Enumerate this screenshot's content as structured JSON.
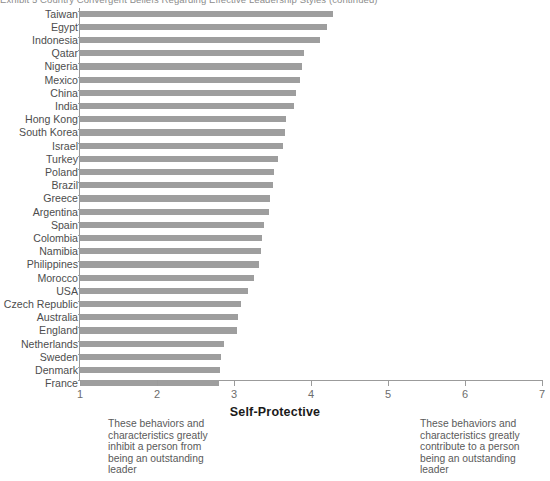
{
  "figure": {
    "title": "Exhibit 5    Country Convergent Beliefs Regarding Effective Leadership Styles (continued)",
    "axis_title": "Self-Protective",
    "note_left": "These behaviors and characteristics greatly inhibit a person from being an outstanding leader",
    "note_right": "These behaviors and characteristics greatly contribute to a person being an outstanding leader",
    "bar_color": "#9e9e9e",
    "axis_color": "#9b9b9b"
  },
  "chart_data": {
    "type": "bar",
    "orientation": "horizontal",
    "title": "Exhibit 5    Country Convergent Beliefs Regarding Effective Leadership Styles (continued)",
    "xlabel": "Self-Protective",
    "ylabel": "",
    "xlim": [
      1,
      7
    ],
    "xticks": [
      1,
      2,
      3,
      4,
      5,
      6,
      7
    ],
    "xtick_labels": [
      "1",
      "2",
      "3",
      "4",
      "5",
      "6",
      "7"
    ],
    "grid": false,
    "legend": null,
    "categories": [
      "Taiwan",
      "Egypt",
      "Indonesia",
      "Qatar",
      "Nigeria",
      "Mexico",
      "China",
      "India",
      "Hong Kong",
      "South Korea",
      "Israel",
      "Turkey",
      "Poland",
      "Brazil",
      "Greece",
      "Argentina",
      "Spain",
      "Colombia",
      "Namibia",
      "Philippines",
      "Morocco",
      "USA",
      "Czech Republic",
      "Australia",
      "England",
      "Netherlands",
      "Sweden",
      "Denmark",
      "France"
    ],
    "values": [
      4.28,
      4.21,
      4.12,
      3.91,
      3.88,
      3.86,
      3.8,
      3.78,
      3.67,
      3.66,
      3.64,
      3.57,
      3.52,
      3.5,
      3.47,
      3.45,
      3.39,
      3.37,
      3.35,
      3.32,
      3.26,
      3.18,
      3.09,
      3.05,
      3.04,
      2.87,
      2.83,
      2.82,
      2.8
    ],
    "annotations": [
      "These behaviors and characteristics greatly inhibit a person from being an outstanding leader",
      "These behaviors and characteristics greatly contribute to a person being an outstanding leader"
    ]
  }
}
